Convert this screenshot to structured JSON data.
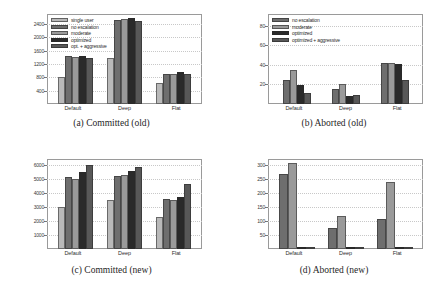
{
  "figure": {
    "panels": [
      {
        "id": "a",
        "caption": "(a) Committed (old)",
        "chart_data": {
          "type": "bar",
          "title": "(a) Committed (old)",
          "xlabel": "",
          "ylabel": "",
          "categories": [
            "Default",
            "Deep",
            "Flat"
          ],
          "yticks": [
            400,
            800,
            1200,
            1600,
            2000,
            2400
          ],
          "ylim": [
            0,
            2700
          ],
          "grid": true,
          "legend_position": "upper-left",
          "series": [
            {
              "name": "single user",
              "color": "#b9b9b9",
              "values": [
                810,
                1380,
                640
              ]
            },
            {
              "name": "no escalation",
              "color": "#6e6e6e",
              "values": [
                1450,
                2510,
                890
              ]
            },
            {
              "name": "moderate",
              "color": "#9a9a9a",
              "values": [
                1420,
                2560,
                900
              ]
            },
            {
              "name": "optimized",
              "color": "#2a2a2a",
              "values": [
                1440,
                2590,
                960
              ]
            },
            {
              "name": "opt. + aggressive",
              "color": "#585858",
              "values": [
                1380,
                2500,
                910
              ]
            }
          ]
        }
      },
      {
        "id": "b",
        "caption": "(b) Aborted (old)",
        "chart_data": {
          "type": "bar",
          "title": "(b) Aborted (old)",
          "xlabel": "",
          "ylabel": "",
          "categories": [
            "Default",
            "Deep",
            "Flat"
          ],
          "yticks": [
            20,
            40,
            60,
            80
          ],
          "ylim": [
            0,
            92
          ],
          "grid": true,
          "legend_position": "upper-left",
          "series": [
            {
              "name": "no escalation",
              "color": "#6e6e6e",
              "values": [
                25,
                15,
                42
              ]
            },
            {
              "name": "moderate",
              "color": "#9a9a9a",
              "values": [
                35,
                20,
                42
              ]
            },
            {
              "name": "optimized",
              "color": "#2a2a2a",
              "values": [
                19,
                8,
                41
              ]
            },
            {
              "name": "optimized + aggressive",
              "color": "#585858",
              "values": [
                11,
                9,
                25
              ]
            }
          ]
        }
      },
      {
        "id": "c",
        "caption": "(c) Committed (new)",
        "chart_data": {
          "type": "bar",
          "title": "(c) Committed (new)",
          "xlabel": "",
          "ylabel": "",
          "categories": [
            "Default",
            "Deep",
            "Flat"
          ],
          "yticks": [
            1000,
            2000,
            3000,
            4000,
            5000,
            6000
          ],
          "ylim": [
            0,
            6400
          ],
          "grid": true,
          "legend_position": "none",
          "series": [
            {
              "name": "single user",
              "color": "#b9b9b9",
              "values": [
                3000,
                3450,
                2250
              ]
            },
            {
              "name": "no escalation",
              "color": "#6e6e6e",
              "values": [
                5100,
                5180,
                3580
              ]
            },
            {
              "name": "moderate",
              "color": "#9a9a9a",
              "values": [
                5000,
                5280,
                3480
              ]
            },
            {
              "name": "optimized",
              "color": "#2a2a2a",
              "values": [
                5500,
                5520,
                3700
              ]
            },
            {
              "name": "opt. + aggressive",
              "color": "#585858",
              "values": [
                6000,
                5850,
                4600
              ]
            }
          ]
        }
      },
      {
        "id": "d",
        "caption": "(d) Aborted (new)",
        "chart_data": {
          "type": "bar",
          "title": "(d) Aborted (new)",
          "xlabel": "",
          "ylabel": "",
          "categories": [
            "Default",
            "Deep",
            "Flat"
          ],
          "yticks": [
            50,
            100,
            150,
            200,
            250,
            300
          ],
          "ylim": [
            0,
            320
          ],
          "grid": true,
          "legend_position": "none",
          "series": [
            {
              "name": "no escalation",
              "color": "#6e6e6e",
              "values": [
                265,
                75,
                105
              ]
            },
            {
              "name": "moderate",
              "color": "#9a9a9a",
              "values": [
                305,
                117,
                238
              ]
            },
            {
              "name": "optimized",
              "color": "#2a2a2a",
              "values": [
                1,
                5,
                3
              ]
            },
            {
              "name": "optimized + aggressive",
              "color": "#585858",
              "values": [
                2,
                3,
                4
              ]
            }
          ]
        }
      }
    ]
  }
}
